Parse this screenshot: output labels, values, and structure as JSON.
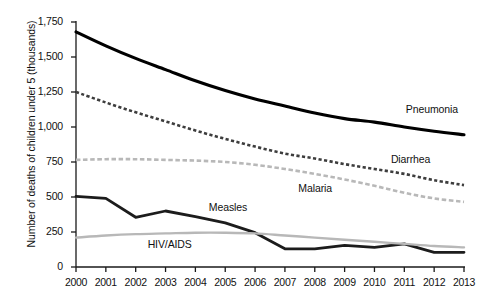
{
  "chart_data": {
    "type": "line",
    "title": "",
    "xlabel": "",
    "ylabel": "Number of deaths of children under 5 (thousands)",
    "x": [
      2000,
      2001,
      2002,
      2003,
      2004,
      2005,
      2006,
      2007,
      2008,
      2009,
      2010,
      2011,
      2012,
      2013
    ],
    "xticklabels": [
      "2000",
      "2001",
      "2002",
      "2003",
      "2004",
      "2005",
      "2006",
      "2007",
      "2008",
      "2009",
      "2010",
      "2011",
      "2012",
      "2013"
    ],
    "yticks": [
      0,
      250,
      500,
      750,
      1000,
      1250,
      1500,
      1750
    ],
    "yticklabels": [
      "0",
      "250",
      "500",
      "750",
      "1,000",
      "1,250",
      "1,500",
      "1,750"
    ],
    "ylim": [
      0,
      1750
    ],
    "xlim": [
      2000,
      2013
    ],
    "grid": false,
    "legend_position": "inline-annotations",
    "series": [
      {
        "name": "Pneumonia",
        "style": "solid",
        "color": "#000000",
        "width": 3.1,
        "label_x": 2011.05,
        "label_y": 1125,
        "values": [
          1680,
          1580,
          1490,
          1410,
          1330,
          1260,
          1200,
          1150,
          1100,
          1060,
          1035,
          1000,
          970,
          945
        ]
      },
      {
        "name": "Diarrhea",
        "style": "dashed",
        "color": "#3d3d3d",
        "width": 2.6,
        "label_x": 2010.55,
        "label_y": 765,
        "values": [
          1250,
          1175,
          1105,
          1040,
          975,
          915,
          860,
          810,
          775,
          735,
          700,
          665,
          620,
          585
        ]
      },
      {
        "name": "Malaria",
        "style": "dashed",
        "color": "#b8b8b8",
        "width": 2.6,
        "label_x": 2007.45,
        "label_y": 555,
        "values": [
          765,
          770,
          770,
          765,
          760,
          750,
          730,
          700,
          665,
          625,
          580,
          530,
          490,
          465
        ]
      },
      {
        "name": "Measles",
        "style": "solid",
        "color": "#1c1c1c",
        "width": 2.8,
        "label_x": 2004.45,
        "label_y": 425,
        "values": [
          505,
          490,
          355,
          400,
          360,
          315,
          245,
          130,
          130,
          155,
          140,
          165,
          105,
          105
        ]
      },
      {
        "name": "HIV/AIDS",
        "style": "solid",
        "color": "#b8b8b8",
        "width": 2.4,
        "label_x": 2002.4,
        "label_y": 160,
        "values": [
          210,
          225,
          235,
          240,
          245,
          245,
          240,
          225,
          210,
          195,
          180,
          165,
          150,
          140
        ]
      }
    ]
  }
}
